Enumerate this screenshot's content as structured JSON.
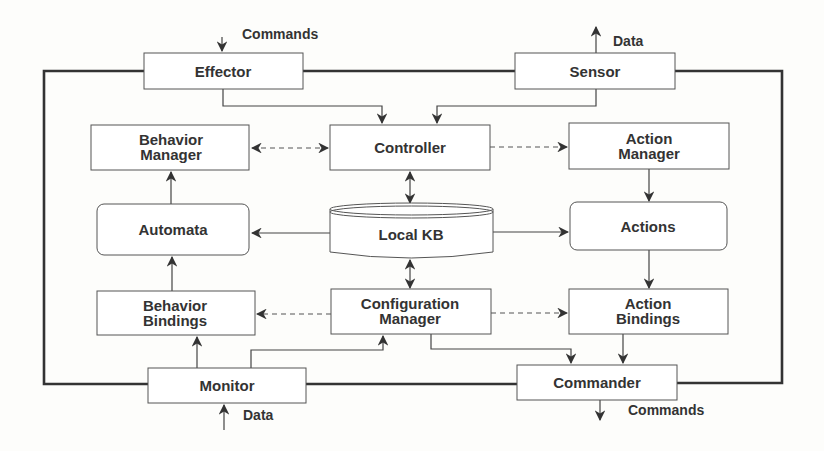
{
  "diagram": {
    "nodes": {
      "effector": {
        "label": "Effector"
      },
      "sensor": {
        "label": "Sensor"
      },
      "behavior_manager": {
        "line1": "Behavior",
        "line2": "Manager"
      },
      "controller": {
        "label": "Controller"
      },
      "action_manager": {
        "line1": "Action",
        "line2": "Manager"
      },
      "automata": {
        "label": "Automata"
      },
      "local_kb": {
        "label": "Local KB"
      },
      "actions": {
        "label": "Actions"
      },
      "behavior_bindings": {
        "line1": "Behavior",
        "line2": "Bindings"
      },
      "configuration_manager": {
        "line1": "Configuration",
        "line2": "Manager"
      },
      "action_bindings": {
        "line1": "Action",
        "line2": "Bindings"
      },
      "monitor": {
        "label": "Monitor"
      },
      "commander": {
        "label": "Commander"
      }
    },
    "io_labels": {
      "commands_in": "Commands",
      "data_out": "Data",
      "data_in": "Data",
      "commands_out": "Commands"
    },
    "edges": [
      {
        "from": "Effector",
        "to": "Controller",
        "style": "solid"
      },
      {
        "from": "Sensor",
        "to": "Controller",
        "style": "solid"
      },
      {
        "from": "Controller",
        "to": "Behavior Manager",
        "style": "dashed",
        "bidirectional": true
      },
      {
        "from": "Controller",
        "to": "Action Manager",
        "style": "dashed"
      },
      {
        "from": "Controller",
        "to": "Local KB",
        "style": "solid",
        "bidirectional": true
      },
      {
        "from": "Local KB",
        "to": "Automata",
        "style": "solid"
      },
      {
        "from": "Local KB",
        "to": "Actions",
        "style": "solid"
      },
      {
        "from": "Local KB",
        "to": "Configuration Manager",
        "style": "solid",
        "bidirectional": true
      },
      {
        "from": "Automata",
        "to": "Behavior Manager",
        "style": "solid"
      },
      {
        "from": "Action Manager",
        "to": "Actions",
        "style": "solid"
      },
      {
        "from": "Actions",
        "to": "Action Bindings",
        "style": "solid"
      },
      {
        "from": "Behavior Bindings",
        "to": "Automata",
        "style": "solid"
      },
      {
        "from": "Configuration Manager",
        "to": "Behavior Bindings",
        "style": "dashed"
      },
      {
        "from": "Configuration Manager",
        "to": "Action Bindings",
        "style": "dashed"
      },
      {
        "from": "Monitor",
        "to": "Behavior Bindings",
        "style": "solid"
      },
      {
        "from": "Monitor",
        "to": "Configuration Manager",
        "style": "solid"
      },
      {
        "from": "Configuration Manager",
        "to": "Commander",
        "style": "solid"
      },
      {
        "from": "Action Bindings",
        "to": "Commander",
        "style": "solid"
      }
    ]
  }
}
